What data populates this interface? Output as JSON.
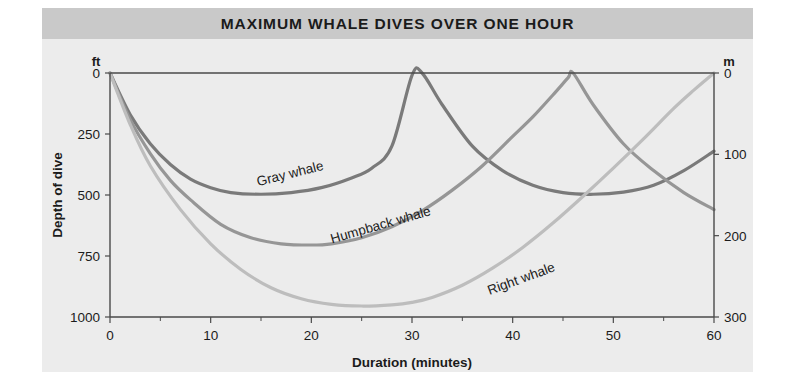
{
  "figure": {
    "title": "MAXIMUM WHALE DIVES OVER ONE HOUR",
    "background_color": "#ececec",
    "title_band_color": "#c9c9c9"
  },
  "chart_data": {
    "type": "line",
    "title": "MAXIMUM WHALE DIVES OVER ONE HOUR",
    "xlabel": "Duration (minutes)",
    "ylabel": "Depth of dive",
    "left_axis_unit": "ft",
    "right_axis_unit": "m",
    "xlim": [
      0,
      60
    ],
    "ylim": [
      0,
      1000
    ],
    "y_right_lim": [
      0,
      300
    ],
    "grid": false,
    "legend_position": "inline-curve-labels",
    "x_ticks": [
      0,
      10,
      20,
      30,
      40,
      50,
      60
    ],
    "x_ticks_minor": [
      5,
      15,
      25,
      35,
      45,
      55
    ],
    "y_ticks_left": [
      0,
      250,
      500,
      750,
      1000
    ],
    "y_ticks_right": [
      0,
      100,
      200,
      300
    ],
    "series": [
      {
        "name": "Gray whale",
        "color": "#7a7a7a",
        "label_x": 18,
        "label_y": 430,
        "label_rotation": -14,
        "points_x": [
          0,
          2,
          4,
          6,
          8,
          10,
          12,
          15,
          18,
          21,
          24,
          26,
          28,
          30,
          31,
          33,
          36,
          39,
          42,
          45,
          48,
          51,
          54,
          57,
          60
        ],
        "points_y": [
          0,
          170,
          290,
          375,
          435,
          470,
          490,
          497,
          490,
          470,
          430,
          390,
          300,
          10,
          0,
          130,
          300,
          400,
          460,
          490,
          497,
          488,
          460,
          400,
          320
        ]
      },
      {
        "name": "Humpback whale",
        "color": "#969696",
        "label_x": 27,
        "label_y": 640,
        "label_rotation": -16,
        "points_x": [
          0,
          2,
          4,
          6,
          8,
          11,
          14,
          17,
          20,
          22,
          25,
          28,
          31,
          34,
          37,
          40,
          42,
          44,
          45.5,
          46,
          48,
          51,
          54,
          57,
          60
        ],
        "points_y": [
          0,
          190,
          330,
          440,
          520,
          620,
          675,
          700,
          705,
          700,
          675,
          630,
          565,
          480,
          380,
          260,
          180,
          90,
          20,
          0,
          130,
          290,
          400,
          490,
          560
        ]
      },
      {
        "name": "Right whale",
        "color": "#bdbdbd",
        "label_x": 41,
        "label_y": 860,
        "label_rotation": -20,
        "points_x": [
          0,
          2,
          4,
          7,
          10,
          13,
          16,
          19,
          22,
          25,
          28,
          30,
          32,
          35,
          38,
          41,
          44,
          47,
          50,
          53,
          56,
          58,
          60
        ],
        "points_y": [
          0,
          210,
          380,
          560,
          700,
          805,
          880,
          925,
          948,
          955,
          950,
          940,
          920,
          870,
          800,
          715,
          615,
          505,
          390,
          270,
          145,
          70,
          0
        ]
      }
    ]
  },
  "axes": {
    "left_unit": "ft",
    "right_unit": "m",
    "y_title": "Depth of dive",
    "x_title": "Duration (minutes)"
  }
}
